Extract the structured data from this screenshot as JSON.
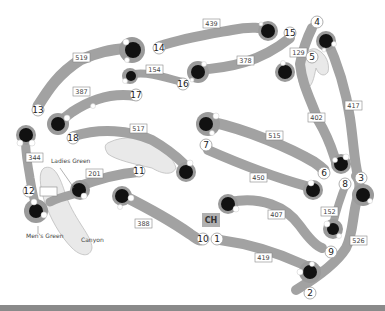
{
  "map": {
    "title": "Golf course layout",
    "colors": {
      "fairway": "#a2a2a2",
      "green": "#111111",
      "water": "#e9e9e9",
      "background": "#ffffff"
    },
    "labels": {
      "ladies_green": "Ladies Green",
      "mens_green": "Men's Green",
      "canyon": "Canyon",
      "clubhouse": "CH"
    },
    "holes": [
      {
        "number": "1",
        "yardage": "419"
      },
      {
        "number": "2",
        "yardage": "526"
      },
      {
        "number": "3",
        "yardage": "417"
      },
      {
        "number": "4",
        "yardage": "402"
      },
      {
        "number": "5",
        "yardage": "129"
      },
      {
        "number": "6",
        "yardage": "515"
      },
      {
        "number": "7",
        "yardage": "450"
      },
      {
        "number": "8",
        "yardage": "152"
      },
      {
        "number": "9",
        "yardage": "407"
      },
      {
        "number": "10",
        "yardage": "388"
      },
      {
        "number": "11",
        "yardage": "201"
      },
      {
        "number": "12",
        "yardage": "344"
      },
      {
        "number": "13",
        "yardage": "519"
      },
      {
        "number": "14",
        "yardage": "439"
      },
      {
        "number": "15",
        "yardage": "378"
      },
      {
        "number": "16",
        "yardage": "154"
      },
      {
        "number": "17",
        "yardage": "387"
      },
      {
        "number": "18",
        "yardage": "517"
      }
    ]
  }
}
